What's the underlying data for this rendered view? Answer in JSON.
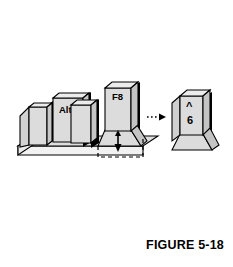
{
  "figure": {
    "caption": "FIGURE 5-18",
    "background_color": "#ffffff",
    "line_color": "#000000",
    "keycap_top_color": "#e8e8e8",
    "keycap_face_color": "#d4d4d4",
    "keycap_side_shadow_color": "#000000",
    "base_top_color": "#e0e0e0",
    "base_front_color": "#efefef"
  },
  "keyboard": {
    "name": "keyboard-key-row",
    "keys": [
      {
        "id": "key-blank-left",
        "label": "",
        "height": "short"
      },
      {
        "id": "key-alt",
        "label": "Alt",
        "height": "medium"
      },
      {
        "id": "key-blank-mid",
        "label": "",
        "height": "short"
      },
      {
        "id": "key-f8",
        "label": "F8",
        "height": "tall"
      }
    ]
  },
  "press_indicator": {
    "name": "press-down-arrow",
    "direction": "down",
    "dashed_outline": true
  },
  "transition_arrow": {
    "name": "dotted-right-arrow",
    "direction": "right",
    "style": "dotted"
  },
  "result_key": {
    "id": "key-caret-six",
    "top_label": "^",
    "bottom_label": "6"
  }
}
